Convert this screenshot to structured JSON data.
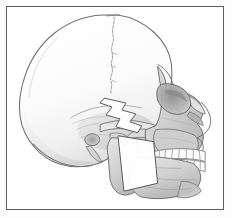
{
  "figure": {
    "title": "Lateral view of human skull",
    "caption": "",
    "medium": "pencil drawing",
    "orientation": "left lateral, facing right",
    "frame": {
      "border_color": "#5e5e5e",
      "border_width_px": 1,
      "inset_px": 6,
      "background_color": "#ffffff"
    },
    "palette": {
      "background": "#fdfdfd",
      "paper": "#ffffff",
      "outline": "#6b6b6b",
      "outline_dark": "#4a4a4a",
      "shade_light": "#efefef",
      "shade_mid": "#dcdcdc",
      "shade_deep": "#c2c2c2",
      "shade_darkest": "#9a9a9a",
      "overlay_fill": "#ffffff",
      "overlay_stroke": "#555555",
      "tooth_fill": "#fbfbfb",
      "tooth_stroke": "#7a7a7a"
    },
    "anatomy": [
      {
        "id": "cranial-vault",
        "label": "Cranial vault (frontal, parietal, occipital)"
      },
      {
        "id": "coronal-suture",
        "label": "Coronal suture"
      },
      {
        "id": "frontal-bone",
        "label": "Frontal bone"
      },
      {
        "id": "orbital-rim",
        "label": "Orbital rim"
      },
      {
        "id": "nasal-bone",
        "label": "Nasal bone"
      },
      {
        "id": "maxilla",
        "label": "Maxilla"
      },
      {
        "id": "zygomatic-arch",
        "label": "Zygomatic arch"
      },
      {
        "id": "temporal-bone",
        "label": "Temporal bone"
      },
      {
        "id": "external-acoustic-meatus",
        "label": "External acoustic meatus"
      },
      {
        "id": "mastoid-process",
        "label": "Mastoid process"
      },
      {
        "id": "mandibular-ramus",
        "label": "Mandibular ramus"
      },
      {
        "id": "mandibular-body",
        "label": "Mandibular body"
      },
      {
        "id": "mental-protuberance",
        "label": "Mental protuberance (chin)"
      },
      {
        "id": "upper-dental-arch",
        "label": "Upper dental arch"
      },
      {
        "id": "lower-dental-arch",
        "label": "Lower dental arch"
      }
    ],
    "overlays": [
      {
        "id": "zigzag-osteotomy-marker",
        "label": "Zigzag osteotomy marker over zygomatic arch",
        "shape": "zigzag",
        "fill": "#ffffff",
        "stroke": "#555555"
      },
      {
        "id": "ramus-resection-overlay",
        "label": "Ramus resection overlay",
        "shape": "quadrilateral",
        "fill": "#ffffff",
        "stroke": "#555555"
      }
    ],
    "teeth": {
      "upper_count": 8,
      "lower_count": 8
    }
  }
}
